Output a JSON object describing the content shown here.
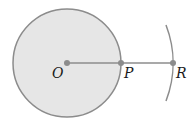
{
  "diagram": {
    "colors": {
      "disk_fill": "#e6e6e6",
      "stroke": "#8c8c8c",
      "point": "#8c8c8c",
      "label": "#1a1a1a",
      "background": "#ffffff"
    },
    "circle": {
      "center": [
        67,
        63
      ],
      "radius": 54
    },
    "arc": {
      "center": [
        67,
        63
      ],
      "radius": 106,
      "start": [
        166,
        25
      ],
      "end": [
        166,
        101
      ]
    },
    "segment": {
      "from": "O",
      "to": "R"
    },
    "points": [
      {
        "id": "O",
        "label": "O",
        "x": 67,
        "y": 63
      },
      {
        "id": "P",
        "label": "P",
        "x": 121,
        "y": 63
      },
      {
        "id": "R",
        "label": "R",
        "x": 173,
        "y": 63
      }
    ]
  }
}
